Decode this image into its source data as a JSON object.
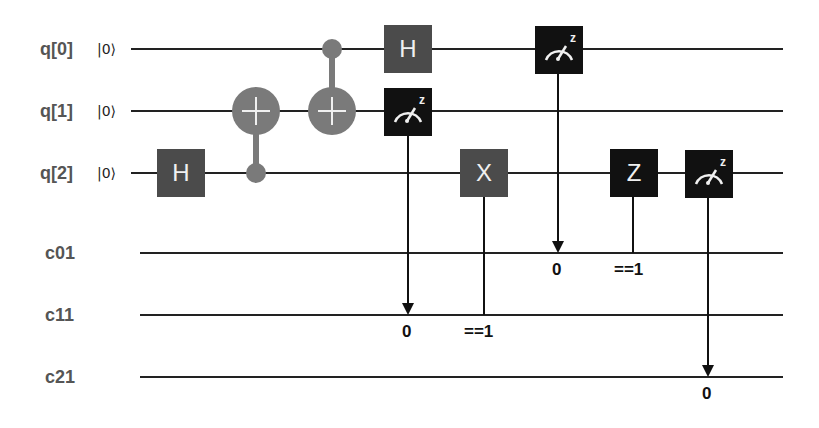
{
  "qubits": [
    {
      "label": "q[0]",
      "init": "|0⟩"
    },
    {
      "label": "q[1]",
      "init": "|0⟩"
    },
    {
      "label": "q[2]",
      "init": "|0⟩"
    }
  ],
  "classical": [
    {
      "label": "c01"
    },
    {
      "label": "c11"
    },
    {
      "label": "c21"
    }
  ],
  "gates": {
    "h_q2": "H",
    "h_q0": "H",
    "x_q2": "X",
    "z_q2": "Z",
    "meas_basis": "z"
  },
  "conditions": {
    "meas_q1_to_c11": "0",
    "x_cond_c11": "==1",
    "meas_q0_to_c01": "0",
    "z_cond_c01": "==1",
    "meas_q2_to_c21": "0"
  },
  "colors": {
    "gate_dark": "#4b4b4b",
    "gate_black": "#111111",
    "cnot": "#7a7a7a",
    "label": "#555555"
  }
}
